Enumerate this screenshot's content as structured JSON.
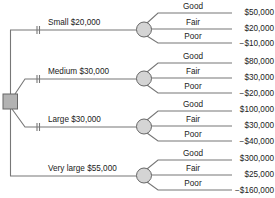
{
  "diagram": {
    "type": "decision-tree",
    "decision_node": {
      "shape": "square",
      "fill": "#b3b3b3",
      "stroke": "#666666"
    },
    "chance_node": {
      "shape": "circle",
      "fill": "#d4d4d4",
      "stroke": "#666666"
    },
    "line_color": "#777777",
    "alternatives": [
      {
        "label": "Small $20,000",
        "name": "Small",
        "cost": "$20,000",
        "blocked_marker": true,
        "outcomes": [
          {
            "label": "Good",
            "payoff": "$50,000"
          },
          {
            "label": "Fair",
            "payoff": "$20,000"
          },
          {
            "label": "Poor",
            "payoff": "−$10,000"
          }
        ]
      },
      {
        "label": "Medium $30,000",
        "name": "Medium",
        "cost": "$30,000",
        "blocked_marker": true,
        "outcomes": [
          {
            "label": "Good",
            "payoff": "$80,000"
          },
          {
            "label": "Fair",
            "payoff": "$30,000"
          },
          {
            "label": "Poor",
            "payoff": "−$20,000"
          }
        ]
      },
      {
        "label": "Large $30,000",
        "name": "Large",
        "cost": "$30,000",
        "blocked_marker": true,
        "outcomes": [
          {
            "label": "Good",
            "payoff": "$100,000"
          },
          {
            "label": "Fair",
            "payoff": "$30,000"
          },
          {
            "label": "Poor",
            "payoff": "−$40,000"
          }
        ]
      },
      {
        "label": "Very large $55,000",
        "name": "Very large",
        "cost": "$55,000",
        "blocked_marker": false,
        "outcomes": [
          {
            "label": "Good",
            "payoff": "$300,000"
          },
          {
            "label": "Fair",
            "payoff": "$25,000"
          },
          {
            "label": "Poor",
            "payoff": "−$160,000"
          }
        ]
      }
    ]
  }
}
